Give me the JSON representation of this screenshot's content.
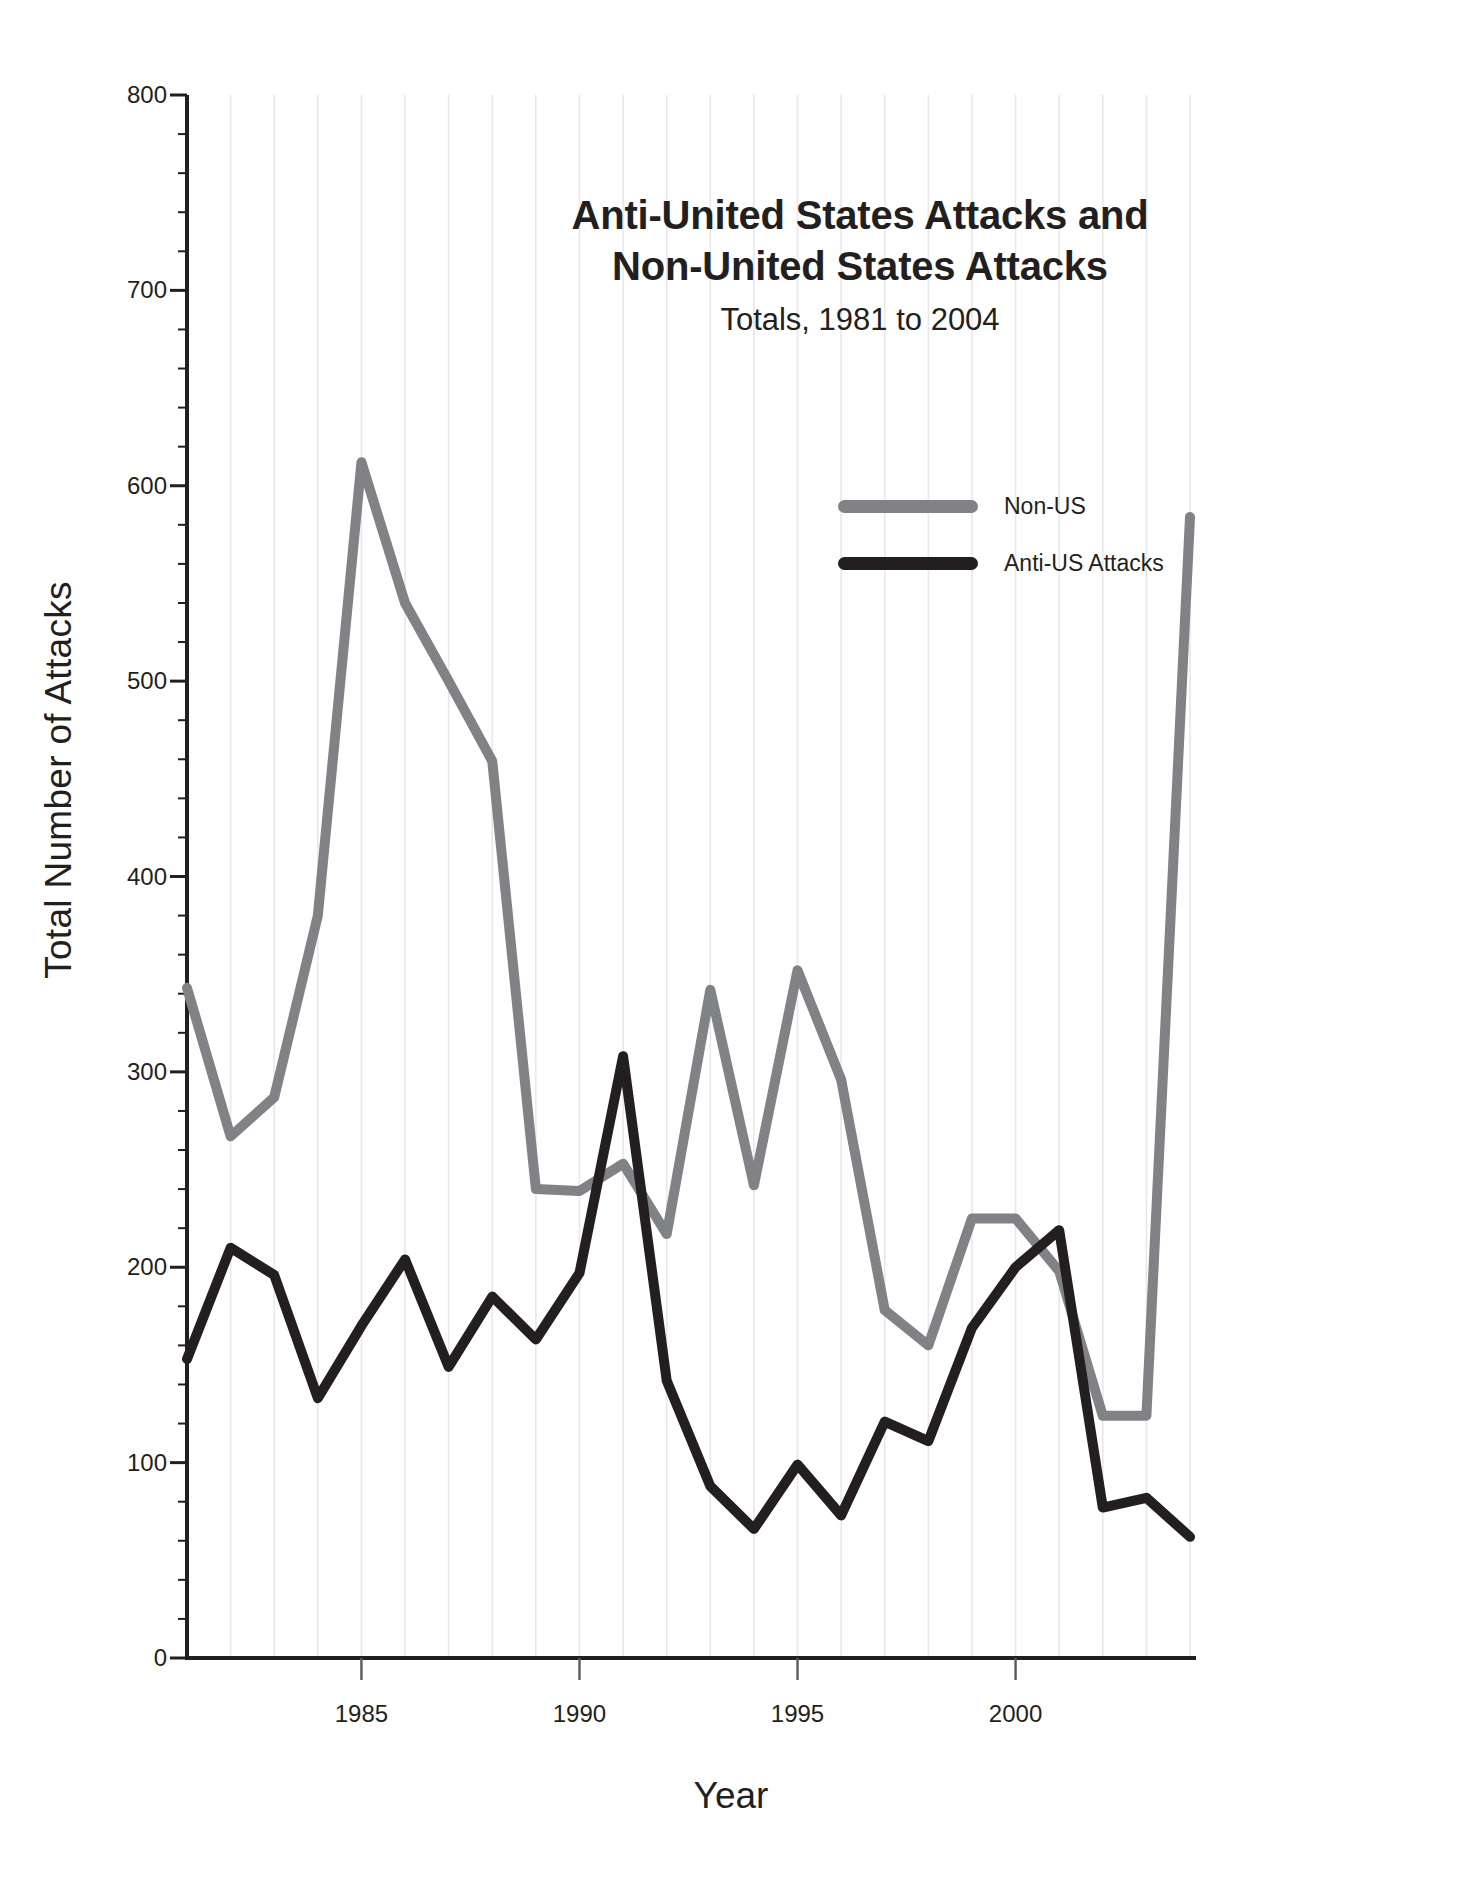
{
  "chart_data": {
    "type": "line",
    "title": "Anti-United States Attacks and Non-United States Attacks",
    "title_lines": [
      "Anti-United States Attacks and",
      "Non-United States Attacks"
    ],
    "subtitle": "Totals, 1981 to 2004",
    "xlabel": "Year",
    "ylabel": "Total Number of Attacks",
    "xlim": [
      1981,
      2004
    ],
    "ylim": [
      0,
      800
    ],
    "yticks": [
      0,
      100,
      200,
      300,
      400,
      500,
      600,
      700,
      800
    ],
    "ytick_labels": [
      "0",
      "100",
      "200",
      "300",
      "400",
      "500",
      "600",
      "700",
      "800"
    ],
    "y_minor_tick_step": 20,
    "xticks": [
      1985,
      1990,
      1995,
      2000
    ],
    "xtick_labels": [
      "1985",
      "1990",
      "1995",
      "2000"
    ],
    "grid": "vertical-minor-only",
    "legend_position": "upper-center-right",
    "x": [
      1981,
      1982,
      1983,
      1984,
      1985,
      1986,
      1987,
      1988,
      1989,
      1990,
      1991,
      1992,
      1993,
      1994,
      1995,
      1996,
      1997,
      1998,
      1999,
      2000,
      2001,
      2002,
      2003,
      2004
    ],
    "series": [
      {
        "name": "Non-US",
        "color": "#808285",
        "values": [
          343,
          267,
          287,
          380,
          612,
          540,
          500,
          459,
          240,
          239,
          253,
          217,
          342,
          242,
          352,
          296,
          178,
          160,
          225,
          225,
          198,
          124,
          124,
          584
        ]
      },
      {
        "name": "Anti-US Attacks",
        "color": "#231f20",
        "values": [
          153,
          210,
          196,
          133,
          170,
          204,
          149,
          185,
          163,
          197,
          308,
          142,
          88,
          66,
          99,
          73,
          121,
          111,
          169,
          200,
          219,
          77,
          82,
          62
        ]
      }
    ]
  },
  "legend": {
    "items": [
      {
        "label": "Non-US",
        "color": "#808285"
      },
      {
        "label": "Anti-US Attacks",
        "color": "#231f20"
      }
    ]
  },
  "axes": {
    "ylabel": "Total Number of Attacks",
    "xlabel": "Year"
  }
}
